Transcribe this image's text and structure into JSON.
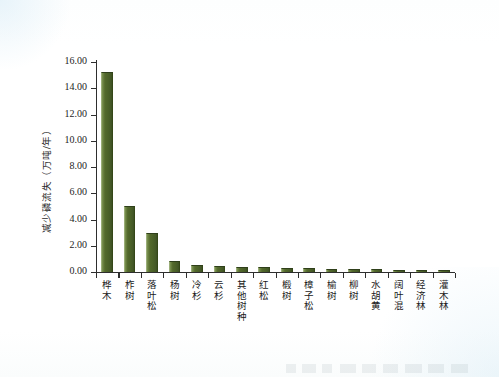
{
  "figure": {
    "ylabel": "减少磷流失（万吨/年）",
    "caption_remnant": ""
  },
  "chart_data": {
    "type": "bar",
    "title": "",
    "subtitle": "",
    "xlabel": "",
    "ylabel": "减少磷流失（万吨/年）",
    "ylim": [
      0.0,
      16.0
    ],
    "ytick_labels": [
      "0.00",
      "2.00",
      "4.00",
      "6.00",
      "8.00",
      "10.00",
      "12.00",
      "14.00",
      "16.00"
    ],
    "ytick_values": [
      0,
      2,
      4,
      6,
      8,
      10,
      12,
      14,
      16
    ],
    "grid": false,
    "legend": false,
    "legend_position": "none",
    "bar_color": "#4b6128",
    "bar_edge_color": "#2f3f1b",
    "axis_color": "#2e2e2e",
    "categories": [
      "桦木",
      "柞树",
      "落叶松",
      "杨树",
      "冷杉",
      "云杉",
      "其他树种",
      "红松",
      "椴树",
      "樟子松",
      "榆树",
      "柳树",
      "水胡黄",
      "阔叶混",
      "经济林",
      "灌木林"
    ],
    "values": [
      15.25,
      5.0,
      3.0,
      0.85,
      0.55,
      0.45,
      0.4,
      0.35,
      0.3,
      0.28,
      0.25,
      0.22,
      0.2,
      0.18,
      0.16,
      0.14
    ]
  }
}
